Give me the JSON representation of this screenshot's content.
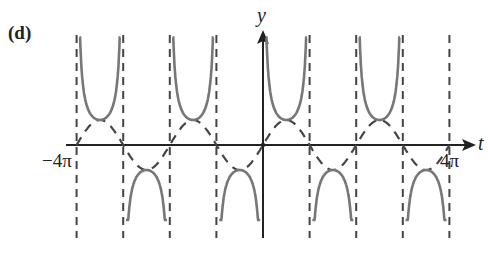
{
  "panel_label": "(d)",
  "axes": {
    "y_label": "y",
    "x_label": "t",
    "tick_left": "−4π",
    "tick_right": "4π"
  },
  "colors": {
    "solid": "#777777",
    "dashed": "#444444",
    "axis": "#222222"
  },
  "chart_data": {
    "type": "line",
    "title": "(d)",
    "xlabel": "t",
    "ylabel": "y",
    "xlim": [
      -4,
      4
    ],
    "x_units": "π",
    "x_tick_labels": [
      "−4π",
      "4π"
    ],
    "grid": false,
    "series": [
      {
        "name": "sin t (dashed)",
        "style": "dashed",
        "function": "y = sin(t)",
        "amplitude": 1,
        "period": "2π"
      },
      {
        "name": "csc t (solid)",
        "style": "solid",
        "function": "y = csc(t)",
        "branches": 8
      }
    ],
    "vertical_asymptotes": [
      "-4π",
      "-3π",
      "-2π",
      "-π",
      "0",
      "π",
      "2π",
      "3π",
      "4π"
    ],
    "legend": "none"
  }
}
